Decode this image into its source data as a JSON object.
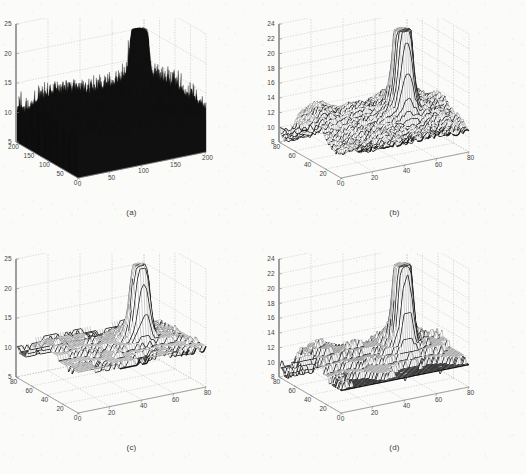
{
  "figure": {
    "background_color": "#fbfbf9",
    "grid_color": "#b9b9b9",
    "axis_color": "#8a8a8a",
    "surface_color": "#111111",
    "mesh_color": "#2b2b2b",
    "tick_font_size": 6.5,
    "caption_font_size": 8
  },
  "captions": {
    "a": "(a)",
    "b": "(b)",
    "c": "(c)",
    "d": "(d)"
  },
  "chart_data": [
    {
      "type": "surface",
      "panel": "a",
      "label": "(a)",
      "title": "",
      "xlabel": "",
      "ylabel": "",
      "zlabel": "",
      "grid": true,
      "legend": "none",
      "projection": "3d",
      "view": {
        "azimuth": -37.5,
        "elevation": 30
      },
      "xlim": [
        0,
        200
      ],
      "ylim": [
        0,
        200
      ],
      "zlim": [
        5,
        25
      ],
      "xticks": [
        0,
        50,
        100,
        150,
        200
      ],
      "yticks": [
        0,
        50,
        100,
        150,
        200
      ],
      "zticks": [
        5,
        10,
        15,
        20,
        25
      ],
      "xticklabels": [
        "0",
        "50",
        "100",
        "150",
        "200"
      ],
      "yticklabels": [
        "0",
        "50",
        "100",
        "150",
        "200"
      ],
      "zticklabels": [
        "5",
        "10",
        "15",
        "20",
        "25"
      ],
      "surface_style": "dense-noisy-spiky",
      "description": "Raw noisy elevation data; dense black spiky mesh with broad plateau near z=11-13 and a tall narrow peak reaching z=23 in the right-rear region.",
      "baseline_z": 11.5,
      "peak_z": 23.5,
      "plateau_z": 12.5,
      "noise_amplitude": 2.5
    },
    {
      "type": "surface",
      "panel": "b",
      "label": "(b)",
      "title": "",
      "xlabel": "",
      "ylabel": "",
      "zlabel": "",
      "grid": true,
      "legend": "none",
      "projection": "3d",
      "view": {
        "azimuth": -37.5,
        "elevation": 30
      },
      "xlim": [
        0,
        80
      ],
      "ylim": [
        0,
        80
      ],
      "zlim": [
        8,
        24
      ],
      "xticks": [
        0,
        20,
        40,
        60,
        80
      ],
      "yticks": [
        0,
        20,
        40,
        60,
        80
      ],
      "zticks": [
        8,
        10,
        12,
        14,
        16,
        18,
        20,
        22,
        24
      ],
      "xticklabels": [
        "0",
        "20",
        "40",
        "60",
        "80"
      ],
      "yticklabels": [
        "0",
        "20",
        "40",
        "60",
        "80"
      ],
      "zticklabels": [
        "8",
        "10",
        "12",
        "14",
        "16",
        "18",
        "20",
        "22",
        "24"
      ],
      "surface_style": "fine-wireframe-mesh",
      "description": "Smoothed / decimated wireframe mesh of the same terrain; plateau around z=12-14 with a tall flat-topped peak reaching about z=23.",
      "baseline_z": 11.0,
      "peak_z": 23.0,
      "plateau_z": 13.0,
      "noise_amplitude": 0.8
    },
    {
      "type": "surface",
      "panel": "c",
      "label": "(c)",
      "title": "",
      "xlabel": "",
      "ylabel": "",
      "zlabel": "",
      "grid": true,
      "legend": "none",
      "projection": "3d",
      "view": {
        "azimuth": -37.5,
        "elevation": 30
      },
      "xlim": [
        0,
        80
      ],
      "ylim": [
        0,
        80
      ],
      "zlim": [
        5,
        25
      ],
      "xticks": [
        0,
        20,
        40,
        60,
        80
      ],
      "yticks": [
        0,
        20,
        40,
        60,
        80
      ],
      "zticks": [
        5,
        10,
        15,
        20,
        25
      ],
      "xticklabels": [
        "0",
        "20",
        "40",
        "60",
        "80"
      ],
      "yticklabels": [
        "0",
        "20",
        "40",
        "60",
        "80"
      ],
      "zticklabels": [
        "5",
        "10",
        "15",
        "20",
        "25"
      ],
      "surface_style": "terraced-flat-mesh",
      "description": "Heavily smoothed terraced surface; broad flat region near z=12 with stepped contour bands and a narrow peak reaching about z=24.",
      "baseline_z": 11.5,
      "peak_z": 24.0,
      "plateau_z": 12.0,
      "noise_amplitude": 0.4
    },
    {
      "type": "surface",
      "panel": "d",
      "label": "(d)",
      "title": "",
      "xlabel": "",
      "ylabel": "",
      "zlabel": "",
      "grid": true,
      "legend": "none",
      "projection": "3d",
      "view": {
        "azimuth": -37.5,
        "elevation": 30
      },
      "xlim": [
        0,
        80
      ],
      "ylim": [
        0,
        80
      ],
      "zlim": [
        8,
        24
      ],
      "xticks": [
        0,
        20,
        40,
        60,
        80
      ],
      "yticks": [
        0,
        20,
        40,
        60,
        80
      ],
      "zticks": [
        8,
        10,
        12,
        14,
        16,
        18,
        20,
        22,
        24
      ],
      "xticklabels": [
        "0",
        "20",
        "40",
        "60",
        "80"
      ],
      "yticklabels": [
        "0",
        "20",
        "40",
        "60",
        "80"
      ],
      "zticklabels": [
        "8",
        "10",
        "12",
        "14",
        "16",
        "18",
        "20",
        "22",
        "24"
      ],
      "surface_style": "terraced-fine-mesh",
      "description": "Reconstructed surface with fine mesh and terraced banding; plateau near z=12-13 and a narrow tall peak reaching about z=23.5.",
      "baseline_z": 11.0,
      "peak_z": 23.5,
      "plateau_z": 12.5,
      "noise_amplitude": 0.5
    }
  ]
}
